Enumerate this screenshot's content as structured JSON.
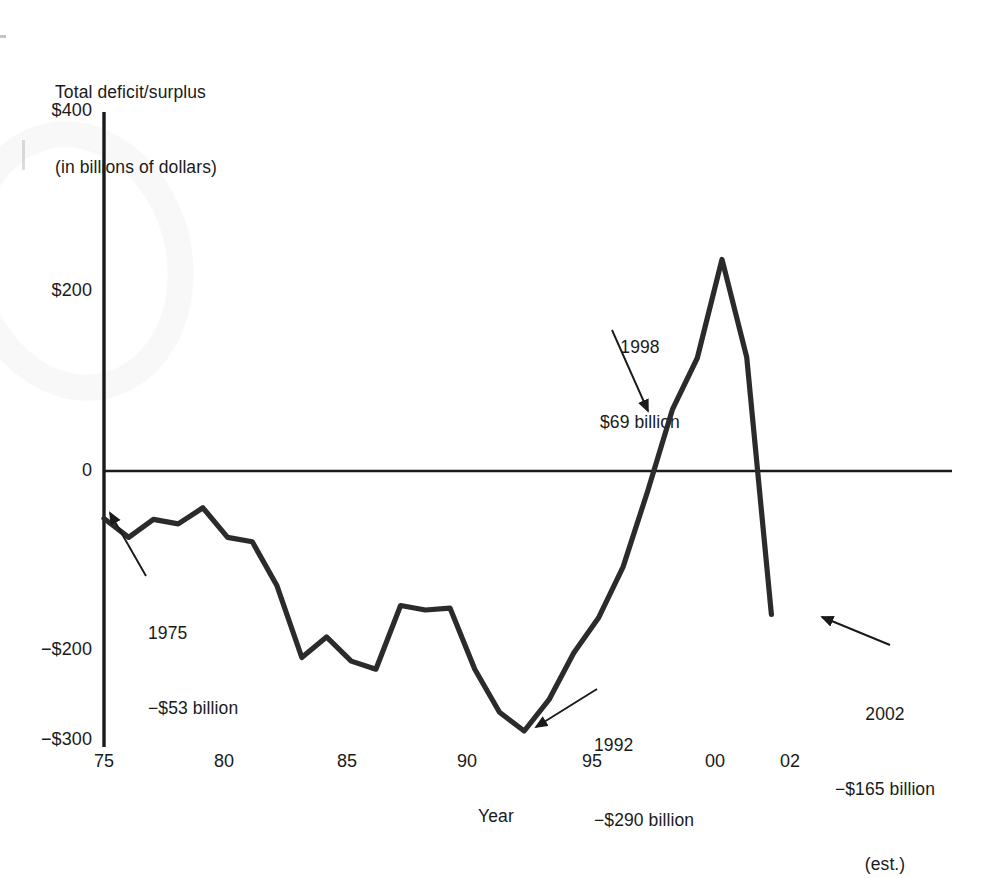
{
  "chart_data": {
    "type": "line",
    "title": "",
    "ylabel_line1": "Total deficit/surplus",
    "ylabel_line2": "(in billions of dollars)",
    "xlabel": "Year",
    "ylim": [
      -300,
      400
    ],
    "xlim": [
      1975,
      2002
    ],
    "ytick_labels": [
      "$400",
      "$200",
      "0",
      "−$200",
      "−$300"
    ],
    "ytick_values": [
      400,
      200,
      0,
      -200,
      -300
    ],
    "xtick_labels": [
      "75",
      "80",
      "85",
      "90",
      "95",
      "00",
      "02"
    ],
    "xtick_values": [
      1975,
      1980,
      1985,
      1990,
      1995,
      2000,
      2002
    ],
    "grid": false,
    "legend": "none",
    "series_name": "Total deficit/surplus",
    "line_color": "#2b2b2b",
    "x": [
      1975,
      1976,
      1977,
      1978,
      1979,
      1980,
      1981,
      1982,
      1983,
      1984,
      1985,
      1986,
      1987,
      1988,
      1989,
      1990,
      1991,
      1992,
      1993,
      1994,
      1995,
      1996,
      1997,
      1998,
      1999,
      2000,
      2001,
      2002
    ],
    "values": [
      -53,
      -74,
      -54,
      -59,
      -41,
      -74,
      -79,
      -128,
      -208,
      -185,
      -212,
      -221,
      -150,
      -155,
      -153,
      -221,
      -269,
      -290,
      -255,
      -203,
      -164,
      -107,
      -22,
      69,
      126,
      236,
      127,
      -160
    ],
    "annotations": [
      {
        "id": "annot-1975",
        "year_label": "1975",
        "value_label": "−$53 billion",
        "extra_label": "",
        "point_x": 1975,
        "point_y": -53
      },
      {
        "id": "annot-1998",
        "year_label": "1998",
        "value_label": "$69 billion",
        "extra_label": "",
        "point_x": 1998,
        "point_y": 69
      },
      {
        "id": "annot-1992",
        "year_label": "1992",
        "value_label": "−$290 billion",
        "extra_label": "",
        "point_x": 1992,
        "point_y": -290
      },
      {
        "id": "annot-2002",
        "year_label": "2002",
        "value_label": "−$165 billion",
        "extra_label": "(est.)",
        "point_x": 2002,
        "point_y": -165
      }
    ]
  },
  "axis": {
    "title_line1": "Total deficit/surplus",
    "title_line2": "(in billions of dollars)",
    "x_title": "Year"
  },
  "yticks": [
    {
      "label": "$400"
    },
    {
      "label": "$200"
    },
    {
      "label": "0"
    },
    {
      "label": "−$200"
    },
    {
      "label": "−$300"
    }
  ],
  "xticks": [
    {
      "label": "75"
    },
    {
      "label": "80"
    },
    {
      "label": "85"
    },
    {
      "label": "90"
    },
    {
      "label": "95"
    },
    {
      "label": "00"
    },
    {
      "label": "02"
    }
  ],
  "annotations": {
    "a1975": {
      "line1": "1975",
      "line2": "−$53 billion"
    },
    "a1998": {
      "line1": "1998",
      "line2": "$69 billion"
    },
    "a1992": {
      "line1": "1992",
      "line2": "−$290 billion"
    },
    "a2002": {
      "line1": "2002",
      "line2": "−$165 billion",
      "line3": "(est.)"
    }
  }
}
